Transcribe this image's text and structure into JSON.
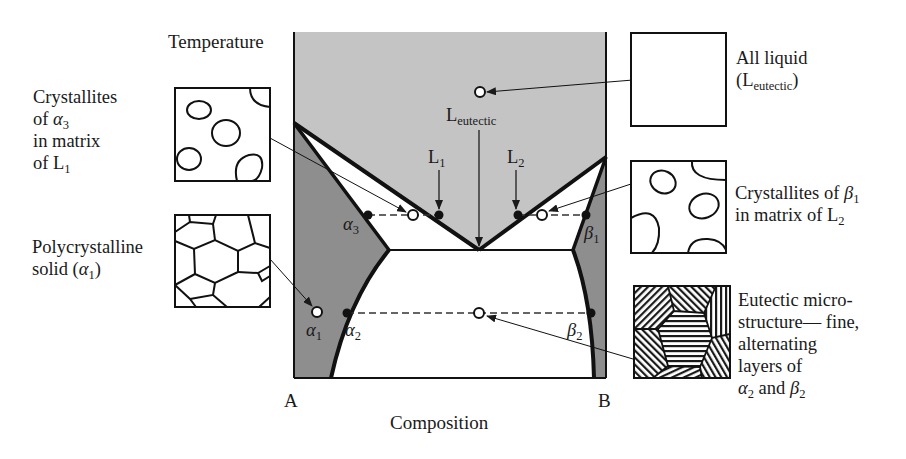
{
  "figure": {
    "axes": {
      "y_label": "Temperature",
      "x_label": "Composition",
      "left_component": "A",
      "right_component": "B"
    },
    "diagram_labels": {
      "l_eutectic": {
        "main": "L",
        "sub": "eutectic"
      },
      "l1": {
        "main": "L",
        "sub": "1"
      },
      "l2": {
        "main": "L",
        "sub": "2"
      },
      "alpha1": {
        "main": "α",
        "sub": "1"
      },
      "alpha2": {
        "main": "α",
        "sub": "2"
      },
      "alpha3": {
        "main": "α",
        "sub": "3"
      },
      "beta1": {
        "main": "β",
        "sub": "1"
      },
      "beta2": {
        "main": "β",
        "sub": "2"
      }
    },
    "regions": [
      {
        "name": "liquid",
        "color": "#c4c4c4"
      },
      {
        "name": "alpha-solid",
        "color": "#8e8e8e"
      },
      {
        "name": "beta-solid",
        "color": "#8e8e8e"
      },
      {
        "name": "two-phase",
        "color": "#ffffff"
      }
    ],
    "callouts": {
      "all_liquid": {
        "line1": "All liquid",
        "paren_open": "(",
        "main": "L",
        "sub": "eutectic",
        "paren_close": ")"
      },
      "alpha3_crystallites": {
        "line1": "Crystallites",
        "line2_pre": "of ",
        "line2_sym": "α",
        "line2_sub": "3",
        "line3": "in matrix",
        "line4_pre": "of L",
        "line4_sub": "1"
      },
      "beta1_crystallites": {
        "line1_pre": "Crystallites of ",
        "line1_sym": "β",
        "line1_sub": "1",
        "line2_pre": "in matrix of L",
        "line2_sub": "2"
      },
      "polycrystalline": {
        "line1": "Polycrystalline",
        "line2_pre": "solid (",
        "line2_sym": "α",
        "line2_sub": "1",
        "line2_post": ")"
      },
      "eutectic_micro": {
        "line1": "Eutectic micro-",
        "line2": "structure— fine,",
        "line3": "alternating",
        "line4": "layers of",
        "line5_sym1": "α",
        "line5_sub1": "2",
        "line5_mid": " and ",
        "line5_sym2": "β",
        "line5_sub2": "2"
      }
    }
  }
}
